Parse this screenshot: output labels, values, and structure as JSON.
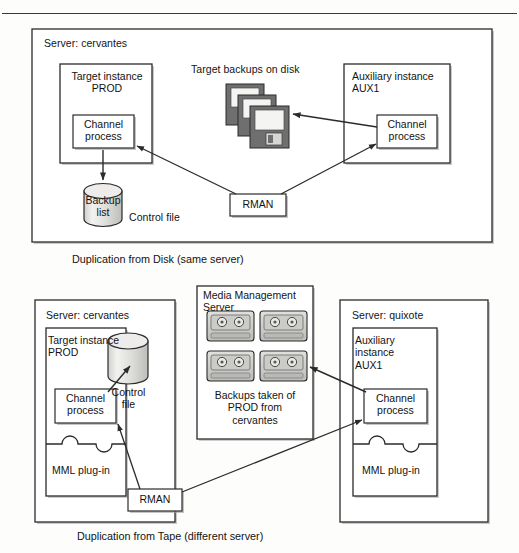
{
  "figure": {
    "type": "diagram",
    "panels": [
      {
        "id": "disk",
        "caption": "Duplication from Disk (same server)",
        "server_label": "Server: cervantes",
        "target_instance": "Target instance\nPROD",
        "target_channel": "Channel\nprocess",
        "backup_store": "Backup\nlist",
        "control_file_label": "Control file",
        "backups_label": "Target backups on disk",
        "aux_instance": "Auxiliary instance\nAUX1",
        "aux_channel": "Channel\nprocess",
        "rman": "RMAN",
        "disk_count": 3
      },
      {
        "id": "tape",
        "caption": "Duplication from Tape (different server)",
        "server_left_label": "Server: cervantes",
        "server_right_label": "Server: quixote",
        "target_instance": "Target instance\nPROD",
        "target_channel": "Channel\nprocess",
        "control_file": "Control\nfile",
        "mml_left": "MML plug-in",
        "mms_title": "Media Management\nServer",
        "mms_caption": "Backups taken of\nPROD from\ncervantes",
        "tape_count": 4,
        "aux_instance": "Auxiliary\ninstance\nAUX1",
        "aux_channel": "Channel\nprocess",
        "mml_right": "MML plug-in",
        "rman": "RMAN"
      }
    ],
    "colors": {
      "stroke": "#2b2b2b",
      "box_fill": "#ffffff",
      "shadow": "#9a9a9a",
      "cylinder_fill": "#d8d8d6",
      "cylinder_top": "#ececeb",
      "disk_body": "#6f6f6f",
      "disk_label": "#f4f4f2",
      "tape_body": "#cfcfcd",
      "page_bg": "#fdfdfc"
    }
  }
}
